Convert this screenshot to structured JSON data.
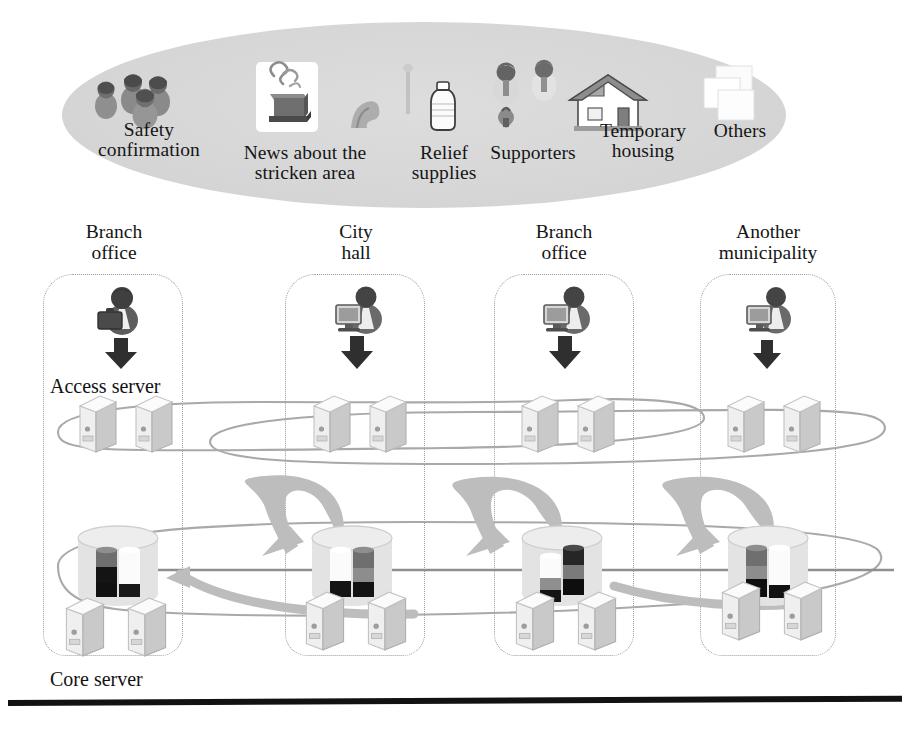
{
  "figure": {
    "background_color": "#ffffff",
    "ellipse_fill": "#d6d6d6",
    "dotted_border_color": "#9a9a9a",
    "network_line_color": "#9c9c9c",
    "arrow_gray": "#b4b4b4",
    "dark_arrow": "#3a3a3a"
  },
  "categories": {
    "container_name": "information-categories-ellipse",
    "items": [
      {
        "label": "Safety\nconfirmation",
        "icon": "people-group-icon"
      },
      {
        "label": "News about the\nstricken area",
        "icon": "burning-building-news-icon"
      },
      {
        "label": "Relief\nsupplies",
        "icon": "relief-supplies-bottle-icon"
      },
      {
        "label": "Supporters",
        "icon": "supporters-volunteers-icon"
      },
      {
        "label": "Temporary\nhousing",
        "icon": "house-icon"
      },
      {
        "label": "Others",
        "icon": "stacked-documents-icon"
      }
    ]
  },
  "sites": {
    "columns": [
      {
        "heading": "Branch\noffice",
        "user_icon": "user-with-briefcase-icon",
        "access_servers": 2,
        "core_servers": 2,
        "storage_icon": "database-cylinder-icon"
      },
      {
        "heading": "City\nhall",
        "user_icon": "user-at-computer-icon",
        "access_servers": 2,
        "core_servers": 2,
        "storage_icon": "database-cylinder-icon"
      },
      {
        "heading": "Branch\noffice",
        "user_icon": "user-at-computer-icon",
        "access_servers": 2,
        "core_servers": 2,
        "storage_icon": "database-cylinder-icon"
      },
      {
        "heading": "Another\nmunicipality",
        "user_icon": "user-at-computer-icon",
        "access_servers": 2,
        "core_servers": 2,
        "storage_icon": "database-cylinder-icon"
      }
    ]
  },
  "labels": {
    "access_server": "Access server",
    "core_server": "Core server"
  },
  "layers": {
    "access_layer_name": "access-server-network-ring",
    "core_layer_name": "core-server-replication-network"
  }
}
